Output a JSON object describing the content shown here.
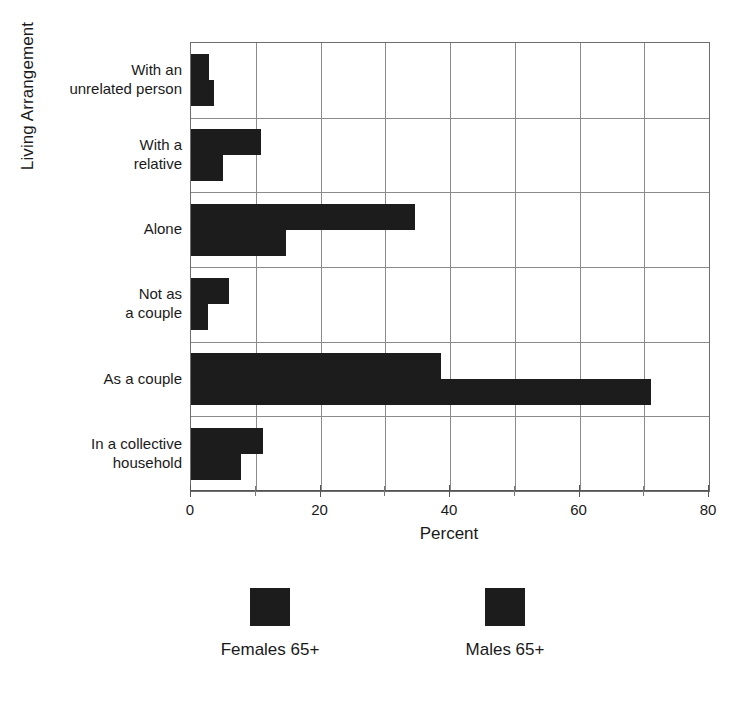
{
  "chart": {
    "type": "bar",
    "orientation": "horizontal",
    "xlabel": "Percent",
    "ylabel": "Living Arrangement",
    "xlim": [
      0,
      80
    ],
    "xticks": [
      0,
      20,
      40,
      60,
      80
    ],
    "xtick_labels": [
      "0",
      "20",
      "40",
      "60",
      "80"
    ],
    "minor_xticks": [
      10,
      30,
      50,
      70
    ],
    "grid": "vertical gridlines every 10 units, horizontal separators between categories",
    "legend_position": "below plot"
  },
  "chart_data": {
    "type": "bar",
    "title": "",
    "xlabel": "Percent",
    "ylabel": "Living Arrangement",
    "xlim": [
      0,
      80
    ],
    "categories": [
      "With an unrelated person",
      "With a relative",
      "Alone",
      "Not as a couple",
      "As a couple",
      "In a collective household"
    ],
    "category_lines": [
      [
        "With an",
        "unrelated person"
      ],
      [
        "With a",
        "relative"
      ],
      [
        "Alone"
      ],
      [
        "Not as",
        "a couple"
      ],
      [
        "As a couple"
      ],
      [
        "In a collective",
        "household"
      ]
    ],
    "series": [
      {
        "name": "Females 65+",
        "color": "#1c1c1c",
        "values": [
          2.8,
          10.8,
          34.6,
          5.9,
          38.6,
          11.1
        ]
      },
      {
        "name": "Males 65+",
        "color": "#1c1c1c",
        "values": [
          3.5,
          5.0,
          14.7,
          2.6,
          71.0,
          7.7
        ]
      }
    ]
  },
  "legend": {
    "entries": [
      {
        "label": "Females 65+",
        "color": "#1c1c1c"
      },
      {
        "label": "Males 65+",
        "color": "#1c1c1c"
      }
    ]
  }
}
